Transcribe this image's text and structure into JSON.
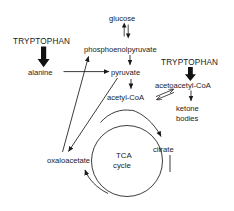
{
  "diagram": {
    "background_color": "#ffffff",
    "line_color": "#1a1a1a",
    "nodes": {
      "tryptophan_left": "TRYPTOPHAN",
      "tryptophan_right": "TRYPTOPHAN",
      "alanine": "alanine",
      "glucose": "glucose",
      "phosphoenolpyruvate": "phosphoenolpyruvate",
      "pyruvate": "pyruvate",
      "acetyl_coa": "acetyl-CoA",
      "acetoacetyl_coa": "acetoacetyl-CoA",
      "ketone": "ketone",
      "bodies": "bodies",
      "oxaloacetate": "oxaloacetate",
      "citrate": "citrate",
      "tca": "TCA",
      "cycle": "cycle"
    },
    "edges": [
      {
        "name": "tryptophan-to-alanine",
        "from": "TRYPTOPHAN",
        "to": "alanine",
        "style": "thick-block-arrow"
      },
      {
        "name": "alanine-to-pyruvate",
        "from": "alanine",
        "to": "pyruvate",
        "style": "arrow"
      },
      {
        "name": "glucose-phosphoenolpyruvate",
        "from": "glucose",
        "to": "phosphoenolpyruvate",
        "style": "reversible-double-arrow"
      },
      {
        "name": "phosphoenolpyruvate-to-pyruvate",
        "from": "phosphoenolpyruvate",
        "to": "pyruvate",
        "style": "arrow"
      },
      {
        "name": "oxaloacetate-to-phosphoenolpyruvate",
        "from": "oxaloacetate",
        "to": "phosphoenolpyruvate",
        "style": "arrow"
      },
      {
        "name": "pyruvate-to-oxaloacetate",
        "from": "pyruvate",
        "to": "oxaloacetate",
        "style": "arrow"
      },
      {
        "name": "pyruvate-to-acetyl-coa",
        "from": "pyruvate",
        "to": "acetyl-CoA",
        "style": "arrow"
      },
      {
        "name": "acetyl-coa-acetoacetyl-coa",
        "from": "acetyl-CoA",
        "to": "acetoacetyl-CoA",
        "style": "reversible-double-arrow"
      },
      {
        "name": "tryptophan-to-acetoacetyl-coa",
        "from": "TRYPTOPHAN",
        "to": "acetoacetyl-CoA",
        "style": "thick-block-arrow"
      },
      {
        "name": "acetoacetyl-coa-to-ketone-bodies",
        "from": "acetoacetyl-CoA",
        "to": "ketone bodies",
        "style": "arrow"
      },
      {
        "name": "acetyl-coa-to-citrate",
        "from": "acetyl-CoA",
        "to": "citrate",
        "style": "curved-arrow"
      },
      {
        "name": "oxaloacetate-to-acetyl-coa-arc",
        "from": "oxaloacetate",
        "to": "acetyl-CoA",
        "style": "curved-line"
      },
      {
        "name": "citrate-into-tca-cycle",
        "from": "citrate",
        "to": "TCA cycle",
        "style": "arrow"
      },
      {
        "name": "tca-cycle-to-oxaloacetate",
        "from": "TCA cycle",
        "to": "oxaloacetate",
        "style": "curved-arrow"
      }
    ]
  }
}
